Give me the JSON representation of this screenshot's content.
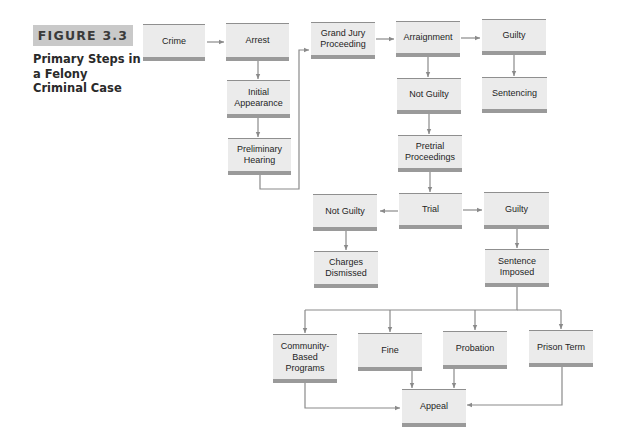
{
  "figure": {
    "label": "FIGURE 3.3",
    "title": "Primary Steps in a Felony Criminal Case"
  },
  "nodes": {
    "crime": "Crime",
    "arrest": "Arrest",
    "initial_appearance": "Initial Appearance",
    "preliminary_hearing": "Preliminary Hearing",
    "grand_jury": "Grand Jury Proceeding",
    "arraignment": "Arraignment",
    "arraignment_guilty": "Guilty",
    "sentencing": "Sentencing",
    "arraignment_not_guilty": "Not Guilty",
    "pretrial": "Pretrial Proceedings",
    "trial": "Trial",
    "trial_not_guilty": "Not Guilty",
    "charges_dismissed": "Charges Dismissed",
    "trial_guilty": "Guilty",
    "sentence_imposed": "Sentence Imposed",
    "community": "Community-Based Programs",
    "fine": "Fine",
    "probation": "Probation",
    "prison_term": "Prison Term",
    "appeal": "Appeal"
  },
  "edges": [
    [
      "Crime",
      "Arrest"
    ],
    [
      "Arrest",
      "Initial Appearance"
    ],
    [
      "Initial Appearance",
      "Preliminary Hearing"
    ],
    [
      "Preliminary Hearing",
      "Grand Jury Proceeding"
    ],
    [
      "Grand Jury Proceeding",
      "Arraignment"
    ],
    [
      "Arraignment",
      "Guilty"
    ],
    [
      "Guilty",
      "Sentencing"
    ],
    [
      "Arraignment",
      "Not Guilty"
    ],
    [
      "Not Guilty",
      "Pretrial Proceedings"
    ],
    [
      "Pretrial Proceedings",
      "Trial"
    ],
    [
      "Trial",
      "Not Guilty"
    ],
    [
      "Not Guilty",
      "Charges Dismissed"
    ],
    [
      "Trial",
      "Guilty"
    ],
    [
      "Guilty",
      "Sentence Imposed"
    ],
    [
      "Sentence Imposed",
      "Community-Based Programs"
    ],
    [
      "Sentence Imposed",
      "Fine"
    ],
    [
      "Sentence Imposed",
      "Probation"
    ],
    [
      "Sentence Imposed",
      "Prison Term"
    ],
    [
      "Community-Based Programs",
      "Appeal"
    ],
    [
      "Fine",
      "Appeal"
    ],
    [
      "Probation",
      "Appeal"
    ],
    [
      "Prison Term",
      "Appeal"
    ]
  ],
  "colors": {
    "box_fill": "#ebebeb",
    "box_bar": "#9a9a9a",
    "connector": "#8a8a8a",
    "label_bg": "#c9c9c9"
  }
}
